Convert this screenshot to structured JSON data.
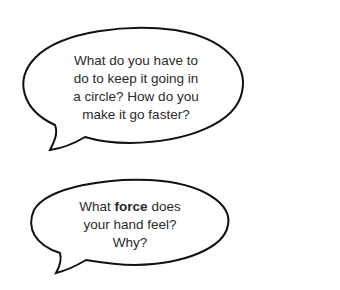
{
  "bubbles": [
    {
      "lines": [
        "What do you have to",
        "do to keep it going in",
        "a circle? How do you",
        "make it go faster?"
      ]
    },
    {
      "line1_pre": "What ",
      "line1_bold": "force",
      "line1_post": " does",
      "line2": "your hand feel?",
      "line3": "Why?"
    }
  ],
  "colors": {
    "outline": "#111111",
    "text": "#2a2a2a",
    "background": "#ffffff"
  }
}
